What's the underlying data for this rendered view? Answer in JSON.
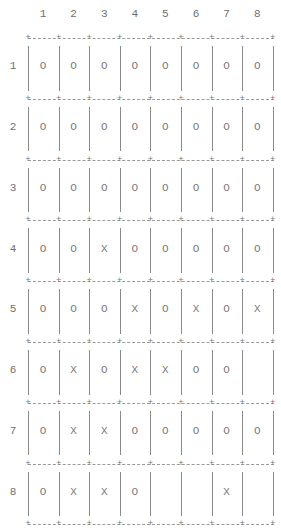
{
  "grid": {
    "column_headers": [
      "1",
      "2",
      "3",
      "4",
      "5",
      "6",
      "7",
      "8"
    ],
    "row_headers": [
      "1",
      "2",
      "3",
      "4",
      "5",
      "6",
      "7",
      "8"
    ],
    "cells": [
      [
        "O",
        "O",
        "O",
        "O",
        "O",
        "O",
        "O",
        "O"
      ],
      [
        "O",
        "O",
        "O",
        "O",
        "O",
        "O",
        "O",
        "O"
      ],
      [
        "O",
        "O",
        "O",
        "O",
        "O",
        "O",
        "O",
        "O"
      ],
      [
        "O",
        "O",
        "X",
        "O",
        "O",
        "O",
        "O",
        "O"
      ],
      [
        "O",
        "O",
        "O",
        "X",
        "O",
        "X",
        "O",
        "X"
      ],
      [
        "O",
        "X",
        "O",
        "X",
        "X",
        "O",
        "O",
        ""
      ],
      [
        "O",
        "X",
        "X",
        "O",
        "O",
        "O",
        "O",
        "O"
      ],
      [
        "O",
        "X",
        "X",
        "O",
        "",
        "",
        "X",
        ""
      ]
    ]
  }
}
